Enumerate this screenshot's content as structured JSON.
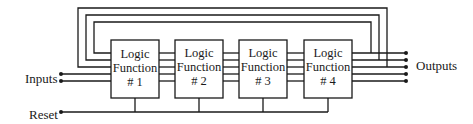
{
  "diagram": {
    "title": "",
    "inputs_label": "Inputs",
    "outputs_label": "Outputs",
    "reset_label": "Reset",
    "blocks": [
      {
        "line1": "Logic",
        "line2": "Function",
        "line3": "# 1"
      },
      {
        "line1": "Logic",
        "line2": "Function",
        "line3": "# 2"
      },
      {
        "line1": "Logic",
        "line2": "Function",
        "line3": "# 3"
      },
      {
        "line1": "Logic",
        "line2": "Function",
        "line3": "# 4"
      }
    ],
    "feedback_loops": 3,
    "inter_block_lines": 5,
    "input_lines": 2,
    "output_lines": 5,
    "line_color": "#1a1a1a"
  }
}
